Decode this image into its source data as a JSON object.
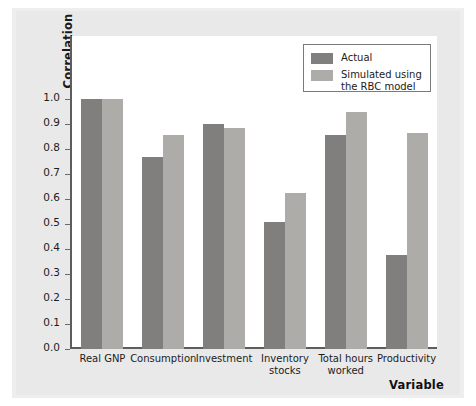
{
  "chart_data": {
    "type": "bar",
    "title": "",
    "xlabel": "Variable",
    "ylabel": "Correlation",
    "categories": [
      "Real GNP",
      "Consumption",
      "Investment",
      "Inventory stocks",
      "Total hours worked",
      "Productivity"
    ],
    "series": [
      {
        "name": "Actual",
        "color": "#807f7d",
        "values": [
          1.0,
          0.77,
          0.9,
          0.51,
          0.855,
          0.375
        ]
      },
      {
        "name": "Simulated using the RBC model",
        "color": "#adaca9",
        "values": [
          1.0,
          0.855,
          0.885,
          0.625,
          0.95,
          0.865
        ]
      }
    ],
    "ylim": [
      0.0,
      1.0
    ],
    "yticks": [
      "0.0",
      "0.1",
      "0.2",
      "0.3",
      "0.4",
      "0.5",
      "0.6",
      "0.7",
      "0.8",
      "0.9",
      "1.0"
    ],
    "ytick_values": [
      0.0,
      0.1,
      0.2,
      0.3,
      0.4,
      0.5,
      0.6,
      0.7,
      0.8,
      0.9,
      1.0
    ],
    "grid": false,
    "legend_position": "top-right"
  },
  "legend": {
    "items": [
      {
        "label": "Actual",
        "color": "#807f7d"
      },
      {
        "label": "Simulated using\nthe RBC model",
        "color": "#adaca9"
      }
    ]
  },
  "axes": {
    "y_title": "Correlation",
    "x_title": "Variable"
  },
  "xlabels": [
    "Real GNP",
    "Consumption",
    "Investment",
    "Inventory\nstocks",
    "Total hours\nworked",
    "Productivity"
  ],
  "colors": {
    "actual": "#807f7d",
    "simulated": "#adaca9",
    "axis": "#5d5d5d",
    "page": "#e9e9e9",
    "plot_bg": "#ffffff"
  }
}
